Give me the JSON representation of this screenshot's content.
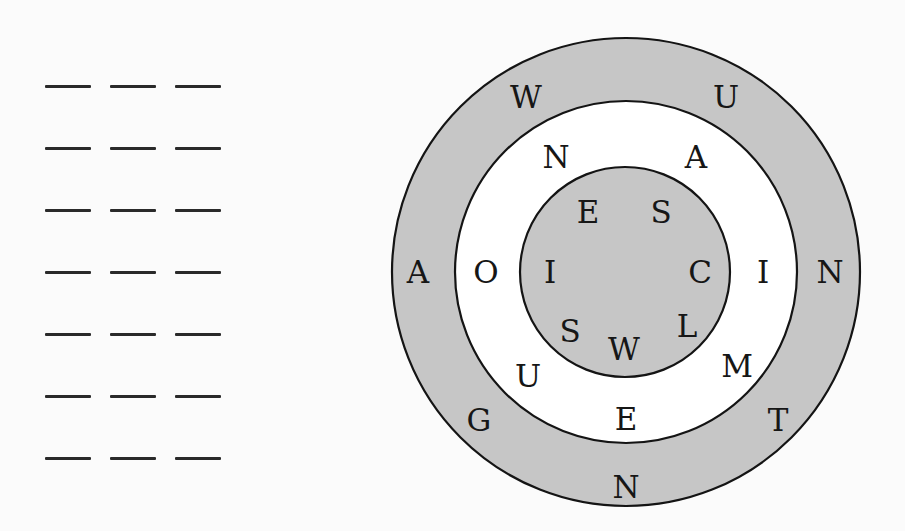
{
  "answer_area": {
    "rows": 7,
    "blanks_per_row": 3,
    "row_y": [
      86,
      148,
      210,
      272,
      334,
      396,
      458
    ]
  },
  "puzzle": {
    "center": [
      626,
      272
    ],
    "colors": {
      "ring_fill": "#c6c6c6",
      "white_fill": "#ffffff",
      "stroke": "#141414",
      "text": "#161616"
    },
    "rings": {
      "outer": {
        "radius": 234,
        "fill": "gray",
        "letters": [
          {
            "char": "W",
            "x": 526,
            "y": 97
          },
          {
            "char": "U",
            "x": 726,
            "y": 97
          },
          {
            "char": "N",
            "x": 830,
            "y": 272
          },
          {
            "char": "T",
            "x": 778,
            "y": 420
          },
          {
            "char": "N",
            "x": 626,
            "y": 487
          },
          {
            "char": "G",
            "x": 479,
            "y": 420
          },
          {
            "char": "A",
            "x": 418,
            "y": 272
          }
        ]
      },
      "middle": {
        "radius": 171,
        "fill": "white",
        "letters": [
          {
            "char": "N",
            "x": 556,
            "y": 157
          },
          {
            "char": "A",
            "x": 696,
            "y": 157
          },
          {
            "char": "I",
            "x": 763,
            "y": 272
          },
          {
            "char": "M",
            "x": 737,
            "y": 366
          },
          {
            "char": "E",
            "x": 626,
            "y": 419
          },
          {
            "char": "U",
            "x": 528,
            "y": 376
          },
          {
            "char": "O",
            "x": 486,
            "y": 272
          }
        ]
      },
      "inner": {
        "radius": 105,
        "fill": "gray",
        "letters": [
          {
            "char": "E",
            "x": 588,
            "y": 212
          },
          {
            "char": "S",
            "x": 661,
            "y": 212
          },
          {
            "char": "C",
            "x": 700,
            "y": 272
          },
          {
            "char": "L",
            "x": 687,
            "y": 326
          },
          {
            "char": "W",
            "x": 624,
            "y": 349
          },
          {
            "char": "S",
            "x": 570,
            "y": 331
          },
          {
            "char": "I",
            "x": 550,
            "y": 272
          }
        ]
      }
    }
  }
}
